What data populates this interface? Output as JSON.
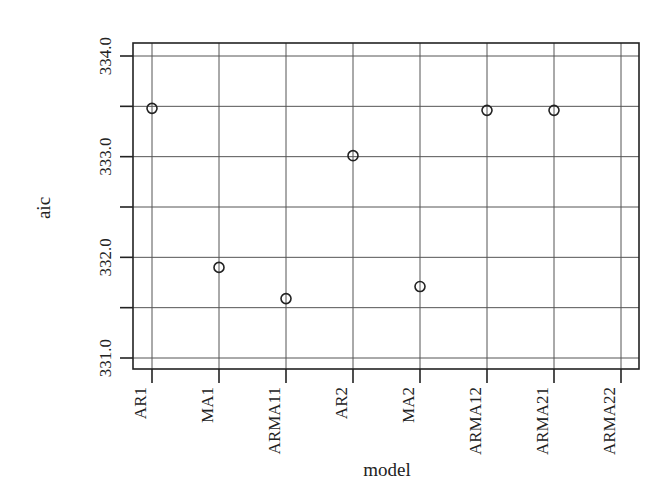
{
  "chart_data": {
    "type": "scatter",
    "title": "",
    "xlabel": "model",
    "ylabel": "aic",
    "categories": [
      "AR1",
      "MA1",
      "ARMA11",
      "AR2",
      "MA2",
      "ARMA12",
      "ARMA21",
      "ARMA22"
    ],
    "values": [
      333.48,
      331.9,
      331.59,
      333.01,
      331.71,
      333.46,
      333.46,
      null
    ],
    "ylim": [
      331.0,
      334.0
    ],
    "yticks": [
      331.0,
      331.5,
      332.0,
      332.5,
      333.0,
      333.5,
      334.0
    ],
    "ytick_labels": [
      "331.0",
      "",
      "332.0",
      "",
      "333.0",
      "",
      "334.0"
    ],
    "grid": true,
    "marker": "open-circle",
    "legend": null
  },
  "layout": {
    "plot": {
      "left": 133,
      "top": 43,
      "right": 639,
      "bottom": 369
    },
    "y_pixel": {
      "334.0": 56,
      "331.0": 358
    },
    "x_first": 152,
    "x_step": 67,
    "colors": {
      "ink": "#222222",
      "grid": "#555555",
      "background": "#ffffff"
    }
  }
}
